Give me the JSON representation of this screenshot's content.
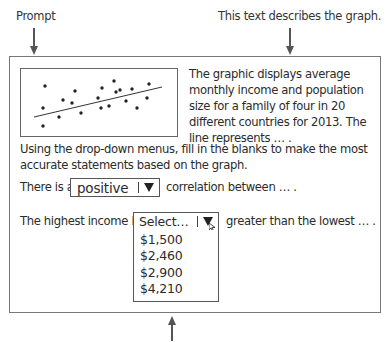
{
  "annotations": {
    "prompt_label": "Prompt",
    "description_label": "This text describes the graph."
  },
  "graph_description": "The graphic displays average monthly income and population size for a family of four in 20 different countries for 2013. The line represents … .",
  "instructions": "Using the drop-down menus, fill in the blanks to make the most accurate statements based on the graph.",
  "question1": {
    "before": "There is a",
    "selected": "positive",
    "after": "correlation between … ."
  },
  "question2": {
    "before": "The highest income is",
    "placeholder": "Select…",
    "after": "greater than the lowest … .",
    "options": [
      "$1,500",
      "$2,460",
      "$2,900",
      "$4,210"
    ]
  },
  "icons": {
    "dropdown_caret": "down-triangle",
    "cursor": "mouse-pointer"
  },
  "chart_data": {
    "type": "scatter",
    "title": "",
    "xlabel": "",
    "ylabel": "",
    "n_points": 20,
    "points": [
      [
        24,
        17
      ],
      [
        22,
        39
      ],
      [
        22,
        57
      ],
      [
        42,
        31
      ],
      [
        38,
        48
      ],
      [
        54,
        22
      ],
      [
        51,
        34
      ],
      [
        60,
        44
      ],
      [
        81,
        19
      ],
      [
        77,
        29
      ],
      [
        80,
        39
      ],
      [
        88,
        37
      ],
      [
        93,
        12
      ],
      [
        95,
        23
      ],
      [
        99,
        21
      ],
      [
        105,
        32
      ],
      [
        111,
        20
      ],
      [
        116,
        39
      ],
      [
        128,
        15
      ],
      [
        126,
        29
      ]
    ],
    "trend_line": {
      "x1": 13,
      "y1": 48,
      "x2": 141,
      "y2": 18
    },
    "grid": false
  }
}
